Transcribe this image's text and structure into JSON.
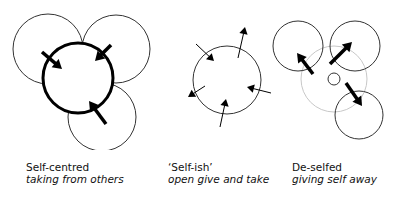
{
  "panels": [
    {
      "id": "self-centred",
      "title": "Self-centred",
      "subtitle": "taking from others",
      "caption_pos": {
        "x": 26,
        "y": 161
      },
      "circles": [
        {
          "name": "other-circle-top-left",
          "cx": 48,
          "cy": 49,
          "r": 35,
          "stroke": "#333333",
          "width": 1
        },
        {
          "name": "other-circle-top-right",
          "cx": 116,
          "cy": 49,
          "r": 34,
          "stroke": "#333333",
          "width": 1
        },
        {
          "name": "other-circle-bottom",
          "cx": 102,
          "cy": 117,
          "r": 34,
          "stroke": "#333333",
          "width": 1
        },
        {
          "name": "self-circle-bold",
          "cx": 78,
          "cy": 78,
          "r": 35,
          "stroke": "#000000",
          "width": 3,
          "fill": "#ffffff"
        }
      ],
      "arrows": [
        {
          "name": "arrow-inward-top-left",
          "x1": 42,
          "y1": 52,
          "x2": 62,
          "y2": 69,
          "width": 3.5,
          "head": 9
        },
        {
          "name": "arrow-inward-top-right",
          "x1": 111,
          "y1": 45,
          "x2": 95,
          "y2": 61,
          "width": 3.5,
          "head": 9
        },
        {
          "name": "arrow-inward-bottom",
          "x1": 106,
          "y1": 124,
          "x2": 89,
          "y2": 101,
          "width": 3.5,
          "head": 9
        }
      ]
    },
    {
      "id": "self-ish",
      "title": "‘Self-ish’",
      "subtitle": "open give and take",
      "caption_pos": {
        "x": 168,
        "y": 161
      },
      "circles": [
        {
          "name": "self-circle",
          "cx": 227,
          "cy": 80,
          "r": 34,
          "stroke": "#333333",
          "width": 1
        }
      ],
      "arrows": [
        {
          "name": "arrow-inward-top-left",
          "x1": 196,
          "y1": 44,
          "x2": 214,
          "y2": 61,
          "width": 1,
          "head": 7
        },
        {
          "name": "arrow-outward-top",
          "x1": 238,
          "y1": 58,
          "x2": 245,
          "y2": 27,
          "width": 1,
          "head": 7
        },
        {
          "name": "arrow-outward-left",
          "x1": 205,
          "y1": 86,
          "x2": 188,
          "y2": 97,
          "width": 1,
          "head": 7
        },
        {
          "name": "arrow-inward-bottom",
          "x1": 220,
          "y1": 127,
          "x2": 226,
          "y2": 99,
          "width": 1,
          "head": 7
        },
        {
          "name": "arrow-inward-right",
          "x1": 271,
          "y1": 93,
          "x2": 247,
          "y2": 87,
          "width": 1,
          "head": 7
        }
      ]
    },
    {
      "id": "de-selfed",
      "title": "De-selfed",
      "subtitle": "giving self away",
      "caption_pos": {
        "x": 292,
        "y": 161
      },
      "circles": [
        {
          "name": "faded-self-circle",
          "cx": 334,
          "cy": 79,
          "r": 33,
          "stroke": "#c8c8c8",
          "width": 1
        },
        {
          "name": "other-circle-top-left",
          "cx": 298,
          "cy": 46,
          "r": 25,
          "stroke": "#333333",
          "width": 1,
          "fill": "none"
        },
        {
          "name": "other-circle-top-right",
          "cx": 355,
          "cy": 46,
          "r": 25,
          "stroke": "#333333",
          "width": 1,
          "fill": "none"
        },
        {
          "name": "other-circle-bottom",
          "cx": 359,
          "cy": 115,
          "r": 24,
          "stroke": "#333333",
          "width": 1,
          "fill": "none"
        },
        {
          "name": "shrunken-self-circle",
          "cx": 334,
          "cy": 79,
          "r": 6,
          "stroke": "#333333",
          "width": 1
        }
      ],
      "arrows": [
        {
          "name": "arrow-outward-top-left",
          "x1": 313,
          "y1": 74,
          "x2": 297,
          "y2": 53,
          "width": 3.5,
          "head": 9
        },
        {
          "name": "arrow-outward-top-right",
          "x1": 330,
          "y1": 64,
          "x2": 352,
          "y2": 42,
          "width": 3.5,
          "head": 9
        },
        {
          "name": "arrow-outward-bottom",
          "x1": 346,
          "y1": 83,
          "x2": 362,
          "y2": 106,
          "width": 3.5,
          "head": 9
        }
      ]
    }
  ]
}
